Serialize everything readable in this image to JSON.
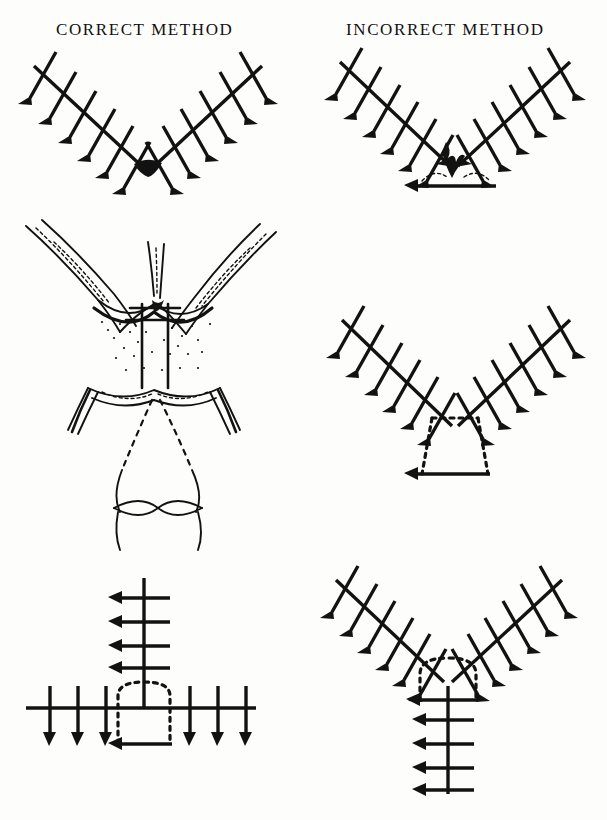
{
  "page": {
    "background_color": "#fdfdfb",
    "ink_color": "#121212",
    "width": 607,
    "height": 820
  },
  "headers": {
    "correct": "CORRECT METHOD",
    "incorrect": "INCORRECT METHOD"
  },
  "figures": [
    {
      "id": "correct-top",
      "column": "correct",
      "row": 1,
      "caption_label": "v-closure-clean-apex",
      "description": "V-shaped sutured incision with evenly spaced interrupted stitches along both limbs meeting at a clean apex with a small dark wedge of approximated tissue",
      "stitch_count_left": 6,
      "stitch_count_right": 6,
      "apex_marker": "solid-dark-wedge",
      "has_baseline": false,
      "has_dotted_outline": false
    },
    {
      "id": "incorrect-top",
      "column": "incorrect",
      "row": 1,
      "caption_label": "v-closure-bunched-apex",
      "description": "V-shaped sutured incision whose limbs are drawn together into a bunched puckered knot of tissue at the apex sitting on a straight horizontal base line, with dotted arcs marking the redundant tissue",
      "stitch_count_left": 6,
      "stitch_count_right": 6,
      "apex_marker": "bunched-puckered-tissue",
      "has_baseline": true,
      "has_dotted_outline": true
    },
    {
      "id": "anatomy",
      "column": "correct",
      "row": 2,
      "caption_label": "nasal-lip-anatomy-flaps",
      "description": "Anatomical line drawing of paired V-shaped tissue flaps with stippled shading and interrupted sutures at the midline, with dotted guide lines descending to an outline of the nose and nostrils below",
      "features": [
        "tissue-flaps",
        "stippled-shading",
        "midline-sutures",
        "dotted-guide-lines",
        "nose-outline",
        "nostril-outline"
      ]
    },
    {
      "id": "incorrect-mid",
      "column": "incorrect",
      "row": 2,
      "caption_label": "v-closure-excess-tissue-trapezoid",
      "description": "V-shaped sutured incision with a dotted trapezoidal outline below the apex showing the excess tissue that has been left, closed across a solid horizontal base line",
      "stitch_count_left": 6,
      "stitch_count_right": 6,
      "apex_marker": "open-v-apex",
      "has_baseline": true,
      "has_dotted_outline": true,
      "dotted_outline_shape": "trapezoid"
    },
    {
      "id": "correct-bottom",
      "column": "correct",
      "row": 3,
      "caption_label": "t-closure-correct",
      "description": "T-shaped closure with a vertical sutured limb meeting a long horizontal sutured limb, a dotted dome outline marking the excised tissue beneath the junction and a short solid line at the base",
      "stitch_count_vertical": 4,
      "stitch_count_horizontal_left": 3,
      "stitch_count_horizontal_right": 3,
      "has_baseline": true,
      "has_dotted_outline": true,
      "dotted_outline_shape": "dome"
    },
    {
      "id": "incorrect-bottom",
      "column": "incorrect",
      "row": 3,
      "caption_label": "y-closure-incorrect",
      "description": "Y-shaped closure where the V limbs converge into a vertical sutured tail, with a dotted dome outline of redundant tissue around the junction and a horizontal line crossing the tail",
      "stitch_count_left": 6,
      "stitch_count_right": 6,
      "stitch_count_tail": 4,
      "has_baseline": true,
      "has_dotted_outline": true,
      "dotted_outline_shape": "dome"
    }
  ]
}
